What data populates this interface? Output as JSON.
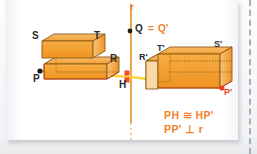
{
  "figure": {
    "type": "geometry-diagram",
    "axis_label": "r",
    "colors": {
      "solid_fill_light": "#f7b25a",
      "solid_fill_mid": "#f29d28",
      "solid_fill_dark": "#e8881a",
      "solid_edge": "#8a5a14",
      "axis": "#f0a03c",
      "ray": "#ffd23f",
      "marker_red": "#e8442a",
      "label_orange": "#ef7f2a",
      "label_dark": "#2b2b2b",
      "panel": "#ffffff"
    }
  },
  "labels": {
    "axis_r": "r",
    "q": "Q",
    "equals": "=",
    "q_prime": "Q'",
    "s": "S",
    "t": "T",
    "r_vertex": "R",
    "p": "P",
    "h": "H",
    "r_prime": "R'",
    "t_prime": "T'",
    "s_prime": "S'",
    "p_prime": "P'"
  },
  "formulas": {
    "line1": "PH ≅ HP'",
    "line2": "PP' ⊥ r"
  },
  "points": {
    "Q": {
      "x": 130,
      "y": 31
    },
    "P": {
      "x": 40,
      "y": 71
    },
    "H": {
      "x": 131,
      "y": 77
    },
    "P_prime": {
      "x": 222,
      "y": 88
    }
  }
}
